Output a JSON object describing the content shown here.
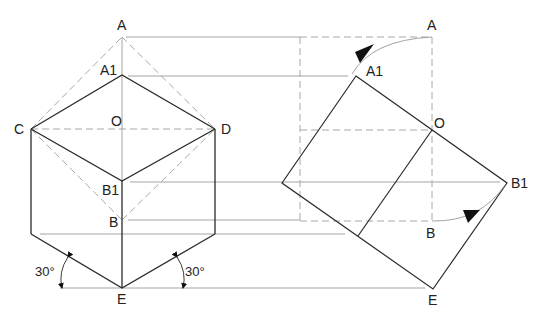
{
  "diagram": {
    "colors": {
      "outline": "#2a2a2a",
      "construction": "#9a9a9a",
      "hidden": "#a8a8a8",
      "text": "#222222"
    },
    "left_figure": {
      "labels": {
        "A": "A",
        "A1": "A1",
        "O": "O",
        "C": "C",
        "D": "D",
        "B1": "B1",
        "B": "B",
        "E": "E"
      },
      "angles": {
        "left": "30°",
        "right": "30°"
      }
    },
    "right_figure": {
      "labels": {
        "A": "A",
        "A1": "A1",
        "O": "O",
        "B1": "B1",
        "B": "B",
        "E": "E"
      }
    }
  }
}
